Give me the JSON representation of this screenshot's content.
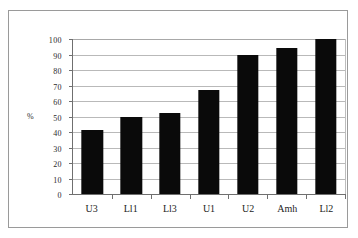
{
  "chart_data": {
    "type": "bar",
    "title": "",
    "subtitle": "",
    "xlabel": "",
    "ylabel": "%",
    "categories": [
      "U3",
      "Ll1",
      "Ll3",
      "U1",
      "U2",
      "Amh",
      "Ll2"
    ],
    "values": [
      41,
      50,
      52,
      67,
      90,
      94,
      100
    ],
    "series": [
      {
        "name": "",
        "values": [
          41,
          50,
          52,
          67,
          90,
          94,
          100
        ]
      }
    ],
    "ylim": [
      0,
      100
    ],
    "y_ticks": [
      0,
      10,
      20,
      30,
      40,
      50,
      60,
      70,
      80,
      90,
      100
    ],
    "y_tick_labels": [
      "0",
      "10",
      "20",
      "30",
      "40",
      "50",
      "60",
      "70",
      "80",
      "90",
      "100"
    ],
    "grid": "horizontal",
    "legend": "none",
    "bar_color": "#0a0a0a",
    "gridline_color": "#b9b9b9",
    "axis_color": "#6f6f6f",
    "frame_color": "#9a9a9a",
    "background_color": "#ffffff"
  }
}
